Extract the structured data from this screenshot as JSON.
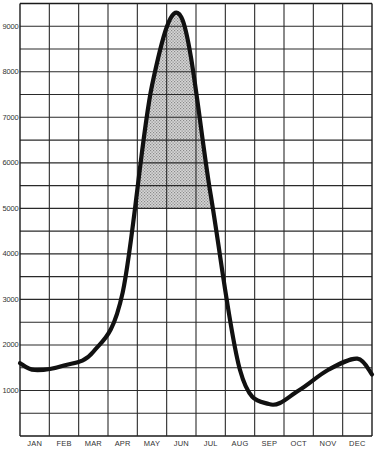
{
  "chart_data": {
    "type": "line",
    "title": "",
    "xlabel": "",
    "ylabel": "",
    "categories": [
      "JAN",
      "FEB",
      "MAR",
      "APR",
      "MAY",
      "JUN",
      "JUL",
      "AUG",
      "SEP",
      "OCT",
      "NOV",
      "DEC"
    ],
    "series": [
      {
        "name": "Seasonal curve",
        "values": [
          1450,
          1550,
          1850,
          3150,
          7700,
          9200,
          5300,
          1450,
          700,
          1000,
          1450,
          1700
        ]
      }
    ],
    "edge_values": {
      "start": 1600,
      "end": 1350
    },
    "ylim": [
      0,
      9500
    ],
    "yticks": [
      1000,
      2000,
      3000,
      4000,
      5000,
      6000,
      7000,
      8000,
      9000
    ],
    "ytick_labels": [
      "1000",
      "2000",
      "3000",
      "4000",
      "5000",
      "6000",
      "7000",
      "8000",
      "9000"
    ],
    "grid": {
      "on": true,
      "y_step": 500,
      "x_columns": 12
    },
    "legend": null,
    "annotations": [
      {
        "type": "shaded-region",
        "description": "Stippled area under the peak, above the 5000 line",
        "y_min": 5000,
        "x_range": [
          "MAY",
          "JUL"
        ],
        "fill": "#bdbdbd"
      }
    ]
  },
  "colors": {
    "background": "#ffffff",
    "grid": "#2a2a2a",
    "curve": "#111111",
    "shade": "#bdbdbd",
    "text": "#333333"
  }
}
